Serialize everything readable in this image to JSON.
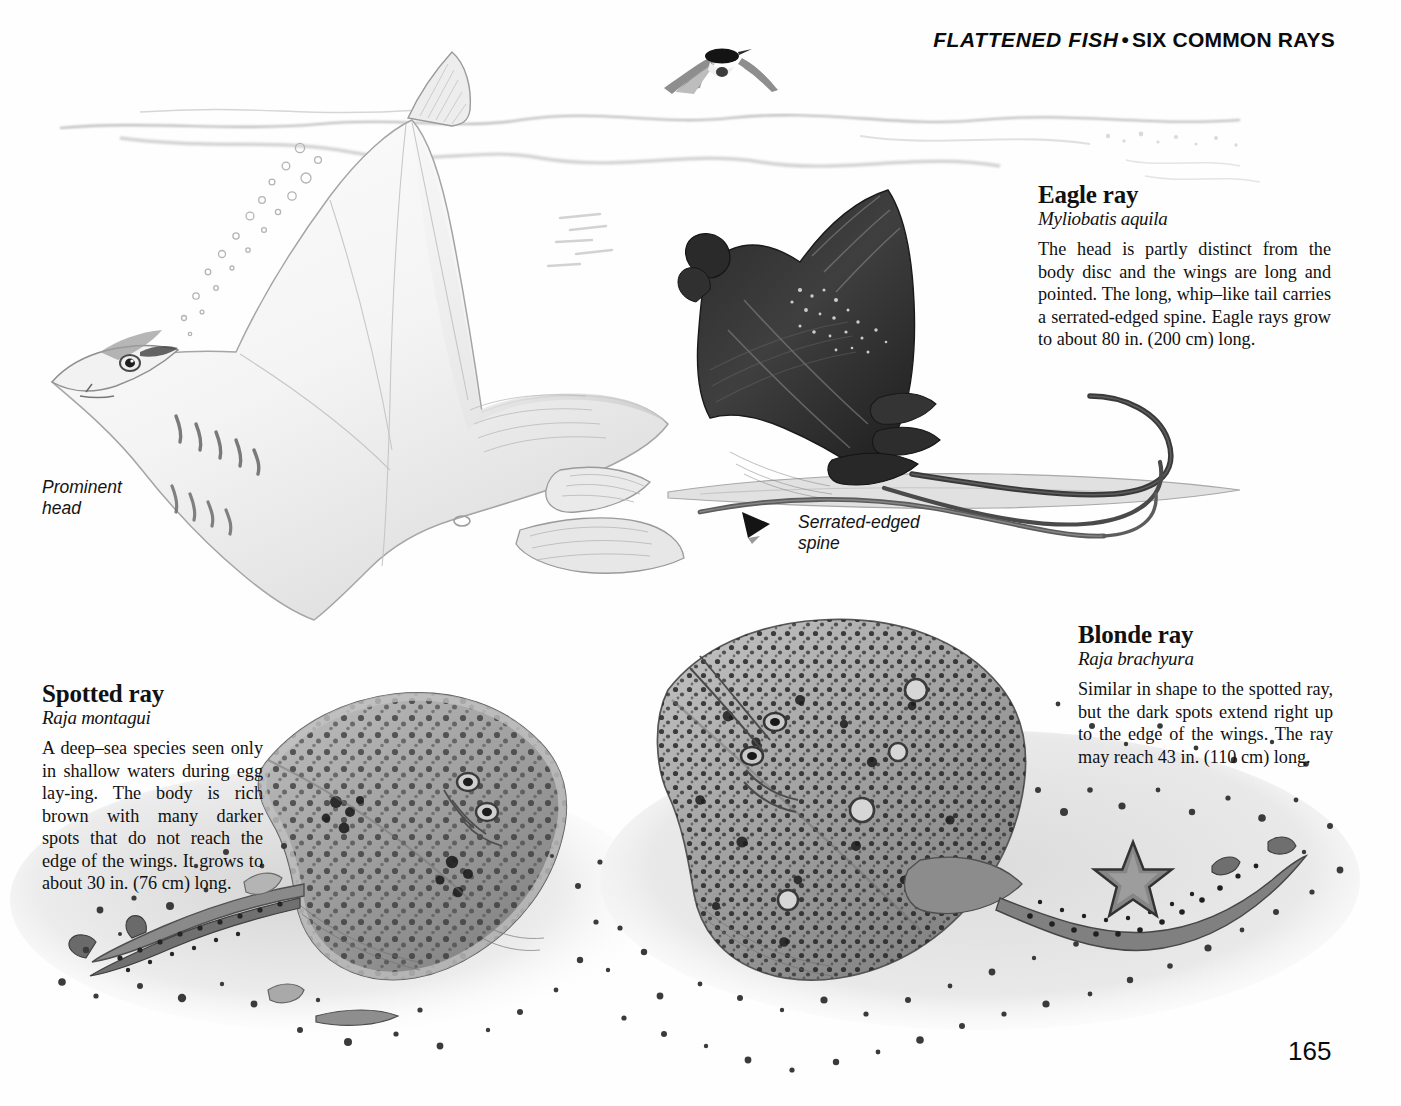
{
  "header": {
    "section_italic": "FLATTENED FISH",
    "separator": "•",
    "topic": "SIX COMMON RAYS"
  },
  "page_number": "165",
  "species": [
    {
      "id": "eagle-ray",
      "common_name": "Eagle ray",
      "scientific_name": "Myliobatis aquila",
      "description": "The head is partly distinct from the body disc and the wings are long and pointed. The long, whip–like tail carries a serrated-edged spine. Eagle rays grow to about 80 in. (200 cm) long."
    },
    {
      "id": "blonde-ray",
      "common_name": "Blonde ray",
      "scientific_name": "Raja brachyura",
      "description": "Similar in shape to the spotted ray, but the dark spots extend right up to the edge of the wings. The ray may reach 43 in. (110 cm) long."
    },
    {
      "id": "spotted-ray",
      "common_name": "Spotted ray",
      "scientific_name": "Raja montagui",
      "description": "A deep–sea species seen only in shallow waters during egg lay-ing. The body is rich brown with many darker spots that do not reach the edge of the wings. It grows to about 30 in. (76 cm) long."
    }
  ],
  "callouts": [
    {
      "id": "prominent-head",
      "line1": "Prominent",
      "line2": "head"
    },
    {
      "id": "serrated-spine",
      "line1": "Serrated-edged",
      "line2": "spine"
    }
  ],
  "illustration": {
    "items": [
      "pale-ray-underside",
      "eagle-ray-dark",
      "flying-tern",
      "water-surface-line",
      "bubble-trail",
      "spotted-ray-on-sand",
      "blonde-ray-on-sand",
      "starfish",
      "seabed-gravel"
    ]
  },
  "colors": {
    "page_background": "#fefefe",
    "ink": "#111111",
    "eagle_ray_dark": "#3a3a3a",
    "ray_mid_grey": "#8d8d8d",
    "sand_grey": "#d8d8d8",
    "spot_dark": "#2e2e2e"
  }
}
